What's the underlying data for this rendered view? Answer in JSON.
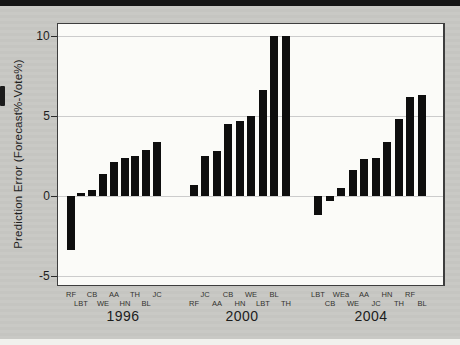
{
  "figure": {
    "kind": "scanned-bar-chart",
    "y_axis_title": "Prediction Error (Forecast%-Vote%)"
  },
  "colors": {
    "bar": "#0e0e0e",
    "background": "#c7c7c3",
    "plot_background": "#fbfbf8",
    "gridline": "#cccccc",
    "frame": "#3e3e3e"
  },
  "chart_data": {
    "type": "bar",
    "title": "",
    "xlabel": "",
    "ylabel": "Prediction Error (Forecast%-Vote%)",
    "ylim": [
      -5.8,
      10.8
    ],
    "yticks": [
      10,
      5,
      0,
      -5
    ],
    "grid": "horizontal",
    "legend": "none",
    "groups": [
      {
        "year": "1996",
        "bars": [
          {
            "label": "RF",
            "value": -3.4
          },
          {
            "label": "LBT",
            "value": 0.2
          },
          {
            "label": "CB",
            "value": 0.4
          },
          {
            "label": "WE",
            "value": 1.4
          },
          {
            "label": "AA",
            "value": 2.1
          },
          {
            "label": "HN",
            "value": 2.4
          },
          {
            "label": "TH",
            "value": 2.5
          },
          {
            "label": "BL",
            "value": 2.9
          },
          {
            "label": "JC",
            "value": 3.4
          }
        ]
      },
      {
        "year": "2000",
        "bars": [
          {
            "label": "RF",
            "value": 0.7
          },
          {
            "label": "JC",
            "value": 2.5
          },
          {
            "label": "AA",
            "value": 2.8
          },
          {
            "label": "CB",
            "value": 4.5
          },
          {
            "label": "HN",
            "value": 4.7
          },
          {
            "label": "WE",
            "value": 5.0
          },
          {
            "label": "LBT",
            "value": 6.6
          },
          {
            "label": "BL",
            "value": 10.0
          },
          {
            "label": "TH",
            "value": 10.0
          }
        ]
      },
      {
        "year": "2004",
        "bars": [
          {
            "label": "LBT",
            "value": -1.2
          },
          {
            "label": "CB",
            "value": -0.3
          },
          {
            "label": "WEa",
            "value": 0.5
          },
          {
            "label": "WE",
            "value": 1.6
          },
          {
            "label": "AA",
            "value": 2.3
          },
          {
            "label": "JC",
            "value": 2.4
          },
          {
            "label": "HN",
            "value": 3.4
          },
          {
            "label": "TH",
            "value": 4.8
          },
          {
            "label": "RF",
            "value": 6.2
          },
          {
            "label": "BL",
            "value": 6.3
          }
        ]
      }
    ]
  }
}
